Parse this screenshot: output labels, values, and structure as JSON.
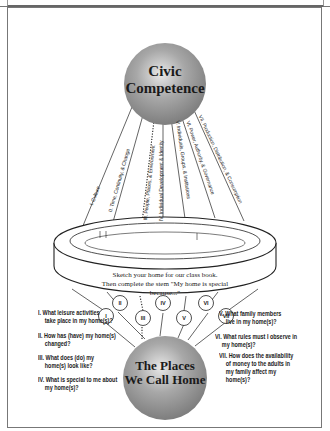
{
  "top_sphere": {
    "line1": "Civic",
    "line2": "Competence",
    "color": "#9a9a9a"
  },
  "themes": [
    {
      "numeral": "I",
      "label": "I. Culture",
      "style": "solid"
    },
    {
      "numeral": "II",
      "label": "II. Time, Continuity, & Change",
      "style": "solid"
    },
    {
      "numeral": "III",
      "label": "III. People, Places, & Environment",
      "style": "dotted"
    },
    {
      "numeral": "IV",
      "label": "IV. Individual Development & Identity",
      "style": "solid"
    },
    {
      "numeral": "V",
      "label": "V. Individuals, Groups, & Institutions",
      "style": "solid"
    },
    {
      "numeral": "VI",
      "label": "VI. Power, Authority, & Governance",
      "style": "solid"
    },
    {
      "numeral": "VII",
      "label": "VII. Production, Distribution, & Consumption",
      "style": "solid"
    }
  ],
  "ring": {
    "line1": "Sketch your home for our class book.",
    "line2": "Then complete the stem \"My home is special",
    "line3": "because...\""
  },
  "nodes": [
    "I",
    "II",
    "III",
    "IV",
    "V",
    "VI",
    "VII"
  ],
  "bottom_sphere": {
    "line1": "The Places",
    "line2": "We Call Home",
    "color": "#9a9a9a"
  },
  "questions_left": [
    {
      "num": "I.",
      "line1": "What leisure activities",
      "line2": "take place in my home(s)?"
    },
    {
      "num": "II.",
      "line1": "How has (have) my home(s)",
      "line2": "changed?"
    },
    {
      "num": "III.",
      "line1": "What does (do) my",
      "line2": "home(s) look like?"
    },
    {
      "num": "IV.",
      "line1": "What is special to me about",
      "line2": "my home(s)?"
    }
  ],
  "questions_right": [
    {
      "num": "V.",
      "line1": "What family members",
      "line2": "live in my home(s)?"
    },
    {
      "num": "VI.",
      "line1": "What rules must I observe in",
      "line2": "my home(s)?"
    },
    {
      "num": "VII.",
      "line1": "How does the availability",
      "line2": "of money to the adults in",
      "line3": "my family affect my",
      "line4": "home(s)?"
    }
  ]
}
